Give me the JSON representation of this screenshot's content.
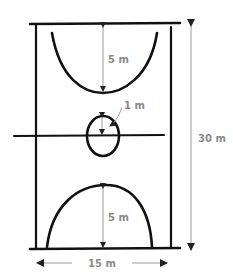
{
  "diagram": {
    "colors": {
      "court_line": "#111111",
      "dimension_line": "#9a9a9a",
      "label_text": "#8a8a8a",
      "background": "#ffffff"
    },
    "labels": {
      "top_arc_depth": "5 m",
      "bottom_arc_depth": "5 m",
      "center_circle_radius": "1 m",
      "court_length": "30 m",
      "court_width": "15 m"
    }
  }
}
